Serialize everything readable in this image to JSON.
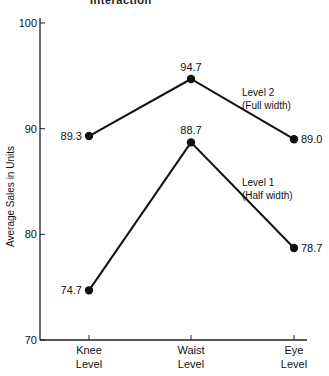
{
  "header": {
    "cut_title": "Interaction"
  },
  "chart_data": {
    "type": "line",
    "title": "",
    "xlabel": "",
    "ylabel": "Average Sales in Units",
    "categories": [
      "Knee\nLevel",
      "Waist\nLevel",
      "Eye\nLevel"
    ],
    "category_lines": [
      [
        "Knee",
        "Level"
      ],
      [
        "Waist",
        "Level"
      ],
      [
        "Eye",
        "Level"
      ]
    ],
    "ylim": [
      70,
      100
    ],
    "yticks": [
      70,
      80,
      90,
      100
    ],
    "grid": false,
    "legend_position": "inline-right",
    "series": [
      {
        "name": "Level 2 (Full width)",
        "label_lines": [
          "Level 2",
          "(Full width)"
        ],
        "values": [
          89.3,
          94.7,
          89.0
        ],
        "value_labels": [
          "89.3",
          "94.7",
          "89.0"
        ]
      },
      {
        "name": "Level 1 (Half width)",
        "label_lines": [
          "Level 1",
          "(Half width)"
        ],
        "values": [
          74.7,
          88.7,
          78.7
        ],
        "value_labels": [
          "74.7",
          "88.7",
          "78.7"
        ]
      }
    ]
  },
  "colors": {
    "line": "#111111",
    "axis": "#222222"
  }
}
